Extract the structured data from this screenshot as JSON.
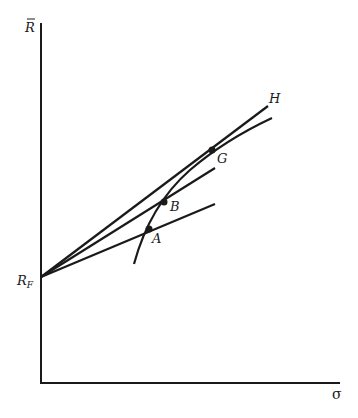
{
  "diagram": {
    "title": "",
    "axes": {
      "y_label": "R̄",
      "x_label": "σ",
      "origin": [
        41,
        383
      ],
      "y_top": 23,
      "x_end": 340
    },
    "intercept": {
      "label": "R_F",
      "label_main": "R",
      "label_sub": "F",
      "point": [
        41,
        277
      ]
    },
    "points": [
      {
        "id": "A",
        "label": "A",
        "xy": [
          149,
          229
        ]
      },
      {
        "id": "B",
        "label": "B",
        "xy": [
          164,
          202
        ]
      },
      {
        "id": "G",
        "label": "G",
        "xy": [
          212,
          150
        ]
      }
    ],
    "lines": [
      {
        "name": "line-through-A",
        "from": [
          41,
          277
        ],
        "to": [
          215,
          204
        ]
      },
      {
        "name": "line-through-B",
        "from": [
          41,
          277
        ],
        "to": [
          215,
          168
        ]
      },
      {
        "name": "line-through-G-H",
        "from": [
          41,
          277
        ],
        "to": [
          268,
          106
        ],
        "end_label": "H"
      }
    ],
    "curve": {
      "name": "efficient-frontier",
      "path": "M134,264 Q150,205 190,170 Q225,140 272,118"
    },
    "colors": {
      "ink": "#1a1a1a",
      "background": "#ffffff"
    }
  }
}
